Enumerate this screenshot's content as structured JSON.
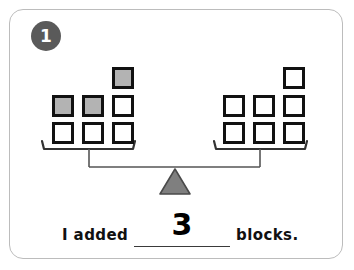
{
  "page": {
    "width": 354,
    "height": 270,
    "background_color": "#ffffff",
    "border_color": "#bcbcbc"
  },
  "problem": {
    "number": "1",
    "badge_fill": "#5a5a5a",
    "badge_text_color": "#ffffff"
  },
  "balance": {
    "fulcrum_fill": "#7f7f7f",
    "fulcrum_stroke": "#4a4a4a",
    "beam_color": "#555555",
    "pan_color": "#333333",
    "block_outline": "#111111",
    "block_white_fill": "#ffffff",
    "block_gray_fill": "#b3b3b3",
    "left_pan": {
      "label": "left-pan",
      "total_blocks": 7,
      "gray_blocks": 3,
      "white_blocks": 4,
      "rows": [
        {
          "row": "top",
          "blocks": [
            null,
            null,
            "gray"
          ]
        },
        {
          "row": "middle",
          "blocks": [
            "gray",
            "gray",
            "white"
          ]
        },
        {
          "row": "bottom",
          "blocks": [
            "white",
            "white",
            "white"
          ]
        }
      ]
    },
    "right_pan": {
      "label": "right-pan",
      "total_blocks": 7,
      "gray_blocks": 0,
      "white_blocks": 7,
      "rows": [
        {
          "row": "top",
          "blocks": [
            null,
            null,
            "white"
          ]
        },
        {
          "row": "middle",
          "blocks": [
            "white",
            "white",
            "white"
          ]
        },
        {
          "row": "bottom",
          "blocks": [
            "white",
            "white",
            "white"
          ]
        }
      ]
    }
  },
  "sentence": {
    "prefix": "I added",
    "answer": "3",
    "suffix": "blocks."
  }
}
